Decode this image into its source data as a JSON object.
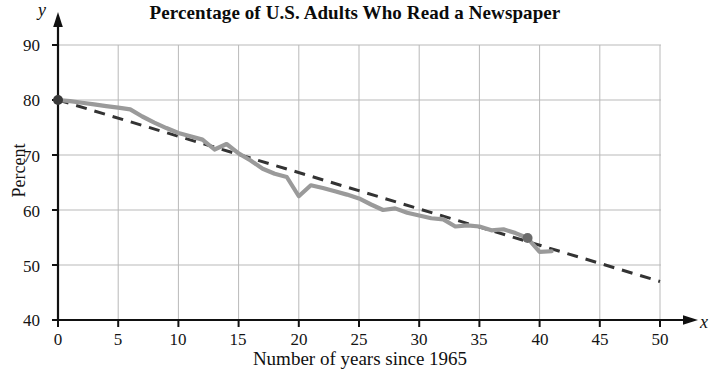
{
  "chart_data": {
    "type": "line",
    "title": "Percentage of U.S. Adults Who Read a Newspaper",
    "xlabel": "Number of years since 1965",
    "ylabel": "Percent",
    "xlim": [
      0,
      50
    ],
    "ylim": [
      40,
      90
    ],
    "xticks": [
      "0",
      "5",
      "10",
      "15",
      "20",
      "25",
      "30",
      "35",
      "40",
      "45",
      "50"
    ],
    "yticks": [
      "40",
      "50",
      "60",
      "70",
      "80",
      "90"
    ],
    "x_axis_symbol": "x",
    "y_axis_symbol": "y",
    "grid": true,
    "legend": "none",
    "series": [
      {
        "name": "Actual percentage of U.S. adults who read a newspaper",
        "style": "solid",
        "color": "#9a9a9a",
        "x": [
          0,
          1,
          2,
          3,
          4,
          5,
          6,
          7,
          8,
          9,
          10,
          11,
          12,
          13,
          14,
          15,
          16,
          17,
          18,
          19,
          20,
          21,
          22,
          23,
          24,
          25,
          26,
          27,
          28,
          29,
          30,
          31,
          32,
          33,
          34,
          35,
          36,
          37,
          38,
          39,
          40,
          41
        ],
        "values": [
          80.0,
          79.8,
          79.5,
          79.2,
          78.9,
          78.6,
          78.3,
          77.0,
          75.9,
          74.9,
          74.0,
          73.4,
          72.8,
          71.0,
          72.0,
          70.3,
          69.0,
          67.5,
          66.6,
          66.0,
          62.5,
          64.5,
          64.0,
          63.4,
          62.8,
          62.1,
          61.0,
          60.0,
          60.3,
          59.5,
          59.0,
          58.5,
          58.3,
          57.0,
          57.2,
          57.0,
          56.3,
          56.5,
          55.8,
          54.9,
          52.4,
          52.5
        ]
      },
      {
        "name": "Linear model trend line",
        "style": "dashed",
        "color": "#333333",
        "x": [
          0,
          50
        ],
        "values": [
          80.0,
          47.0
        ]
      }
    ],
    "annotations": [
      {
        "name": "highlighted-data-point",
        "x": 39,
        "y": 54.9,
        "marker": "filled-circle",
        "color": "#6b6b6b"
      },
      {
        "name": "origin-data-point",
        "x": 0,
        "y": 80.0,
        "marker": "filled-circle",
        "color": "#3a3a3a"
      }
    ]
  }
}
